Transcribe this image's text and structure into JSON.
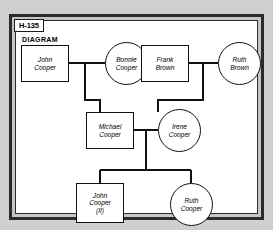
{
  "page": {
    "badge_label": "H-135",
    "section_title": "DIAGRAM",
    "background_color": "#cfcfcf",
    "panel_color": "#ffffff",
    "line_color": "#111111"
  },
  "diagram": {
    "type": "genealogy-family-tree",
    "shape_legend": {
      "rectangle": "male",
      "circle": "female"
    },
    "nodes": [
      {
        "id": "john-cooper",
        "shape": "rectangle",
        "lines": [
          "John",
          "Cooper"
        ],
        "generation": 1
      },
      {
        "id": "bonnie-cooper",
        "shape": "circle",
        "lines": [
          "Bonnie",
          "Cooper"
        ],
        "generation": 1
      },
      {
        "id": "frank-brown",
        "shape": "rectangle",
        "lines": [
          "Frank",
          "Brown"
        ],
        "generation": 1
      },
      {
        "id": "ruth-brown",
        "shape": "circle",
        "lines": [
          "Ruth",
          "Brown"
        ],
        "generation": 1
      },
      {
        "id": "michael-cooper",
        "shape": "rectangle",
        "lines": [
          "Michael",
          "Cooper"
        ],
        "generation": 2
      },
      {
        "id": "irene-cooper",
        "shape": "circle",
        "lines": [
          "Irene",
          "Cooper"
        ],
        "generation": 2
      },
      {
        "id": "john-cooper-ii",
        "shape": "rectangle",
        "lines": [
          "John",
          "Cooper",
          "(II)"
        ],
        "generation": 3
      },
      {
        "id": "ruth-cooper",
        "shape": "circle",
        "lines": [
          "Ruth",
          "Cooper"
        ],
        "generation": 3
      }
    ],
    "unions": [
      {
        "partners": [
          "john-cooper",
          "bonnie-cooper"
        ],
        "children": [
          "michael-cooper"
        ]
      },
      {
        "partners": [
          "frank-brown",
          "ruth-brown"
        ],
        "children": [
          "irene-cooper"
        ]
      },
      {
        "partners": [
          "michael-cooper",
          "irene-cooper"
        ],
        "children": [
          "john-cooper-ii",
          "ruth-cooper"
        ]
      }
    ]
  }
}
